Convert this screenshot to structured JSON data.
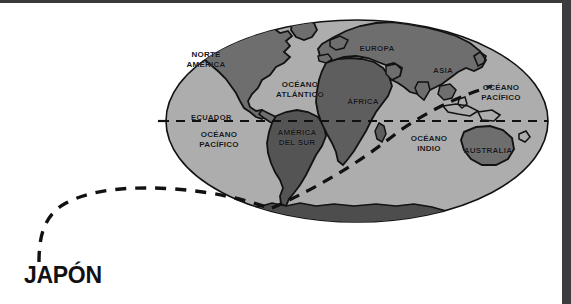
{
  "figure": {
    "type": "world-map-oval-projection",
    "origin_label": "JAPÓN",
    "equator_label": "ECUADOR",
    "colors": {
      "ocean": "#adadad",
      "land": "#6e6e6e",
      "outline": "#121212",
      "route": "#111111",
      "antarctica": "#4d4d4d",
      "background": "#ffffff",
      "scan_bar": "#3d3d3d"
    }
  },
  "continents": [
    {
      "name": "NORTE\nAMÉRICA",
      "x": 206,
      "y": 50
    },
    {
      "name": "EUROPA",
      "x": 377,
      "y": 44
    },
    {
      "name": "ASIA",
      "x": 443,
      "y": 66
    },
    {
      "name": "ÁFRICA",
      "x": 363,
      "y": 97
    },
    {
      "name": "AMÉRICA\nDEL SUR",
      "x": 297,
      "y": 138
    },
    {
      "name": "AUSTRALIA",
      "x": 488,
      "y": 150
    }
  ],
  "oceans": [
    {
      "name": "OCÉANO\nATLÁNTICO",
      "x": 300,
      "y": 86
    },
    {
      "name": "OCÉANO\nPACÍFICO",
      "x": 501,
      "y": 89
    },
    {
      "name": "OCÉANO\nPACÍFICO",
      "x": 219,
      "y": 136
    },
    {
      "name": "OCÉANO\nINDIO",
      "x": 429,
      "y": 140
    }
  ],
  "lines": [
    {
      "name": "equator",
      "style": "dashed",
      "label": "ECUADOR"
    },
    {
      "name": "route-from-japan",
      "style": "dashed",
      "label": "JAPÓN"
    }
  ]
}
